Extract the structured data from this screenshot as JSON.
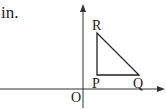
{
  "text_snippet": "in.",
  "diagram": {
    "axes": {
      "x_axis": true,
      "y_axis": true,
      "origin_label": "O"
    },
    "triangle": {
      "vertices": [
        {
          "label": "R",
          "position": "top-left"
        },
        {
          "label": "P",
          "position": "bottom-left (right angle)"
        },
        {
          "label": "Q",
          "position": "bottom-right"
        }
      ]
    },
    "labels": {
      "R": "R",
      "P": "P",
      "Q": "Q",
      "O": "O"
    }
  }
}
